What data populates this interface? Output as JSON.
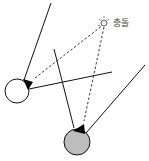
{
  "diagram": {
    "collision_label": "충돌",
    "colors": {
      "line": "#111111",
      "dashed": "#222222",
      "ball_a_fill": "#ffffff",
      "ball_b_fill": "#bdbdbd",
      "marker": "#000000"
    },
    "balls": [
      {
        "name": "white-ball",
        "cx": 17,
        "cy": 91,
        "r": 12
      },
      {
        "name": "gray-ball",
        "cx": 77,
        "cy": 142,
        "r": 13
      }
    ]
  }
}
